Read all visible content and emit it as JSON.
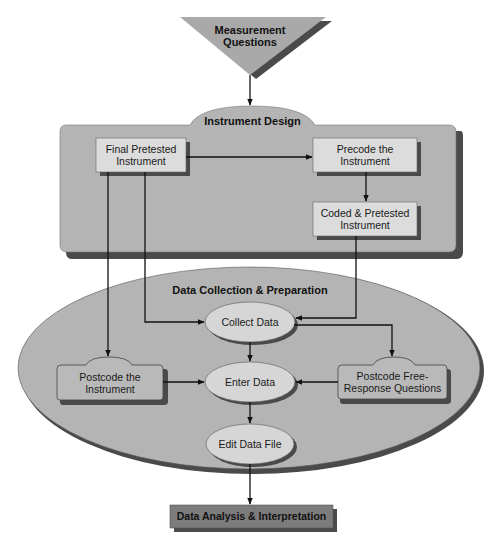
{
  "diagram": {
    "colors": {
      "container_fill": "#b4b4b4",
      "box_fill": "#dcdcdc",
      "ellipse_fill": "#d6d6d6",
      "shadow": "#4a4a4a",
      "triangle_fill": "#a9a9a9",
      "bottom_box_fill": "#7c7c7c",
      "line": "#111111"
    },
    "start": {
      "label_line1": "Measurement",
      "label_line2": "Questions"
    },
    "instrument_design": {
      "title": "Instrument Design",
      "final_pretested": {
        "line1": "Final Pretested",
        "line2": "Instrument"
      },
      "precode": {
        "line1": "Precode the",
        "line2": "Instrument"
      },
      "coded_pretested": {
        "line1": "Coded & Pretested",
        "line2": "Instrument"
      }
    },
    "data_collection": {
      "title": "Data Collection & Preparation",
      "collect": "Collect Data",
      "enter": "Enter Data",
      "edit": "Edit Data File",
      "postcode_instrument": {
        "line1": "Postcode the",
        "line2": "Instrument"
      },
      "postcode_free": {
        "line1": "Postcode Free-",
        "line2": "Response Questions"
      }
    },
    "end": {
      "label": "Data Analysis & Interpretation"
    },
    "edges": [
      {
        "from": "Measurement Questions",
        "to": "Instrument Design"
      },
      {
        "from": "Final Pretested Instrument",
        "to": "Precode the Instrument"
      },
      {
        "from": "Precode the Instrument",
        "to": "Coded & Pretested Instrument"
      },
      {
        "from": "Final Pretested Instrument",
        "to": "Postcode the Instrument"
      },
      {
        "from": "Final Pretested Instrument",
        "to": "Collect Data"
      },
      {
        "from": "Coded & Pretested Instrument",
        "to": "Collect Data"
      },
      {
        "from": "Collect Data",
        "to": "Enter Data"
      },
      {
        "from": "Collect Data",
        "to": "Postcode Free-Response Questions"
      },
      {
        "from": "Postcode the Instrument",
        "to": "Enter Data"
      },
      {
        "from": "Postcode Free-Response Questions",
        "to": "Enter Data"
      },
      {
        "from": "Enter Data",
        "to": "Edit Data File"
      },
      {
        "from": "Edit Data File",
        "to": "Data Analysis & Interpretation"
      }
    ]
  }
}
